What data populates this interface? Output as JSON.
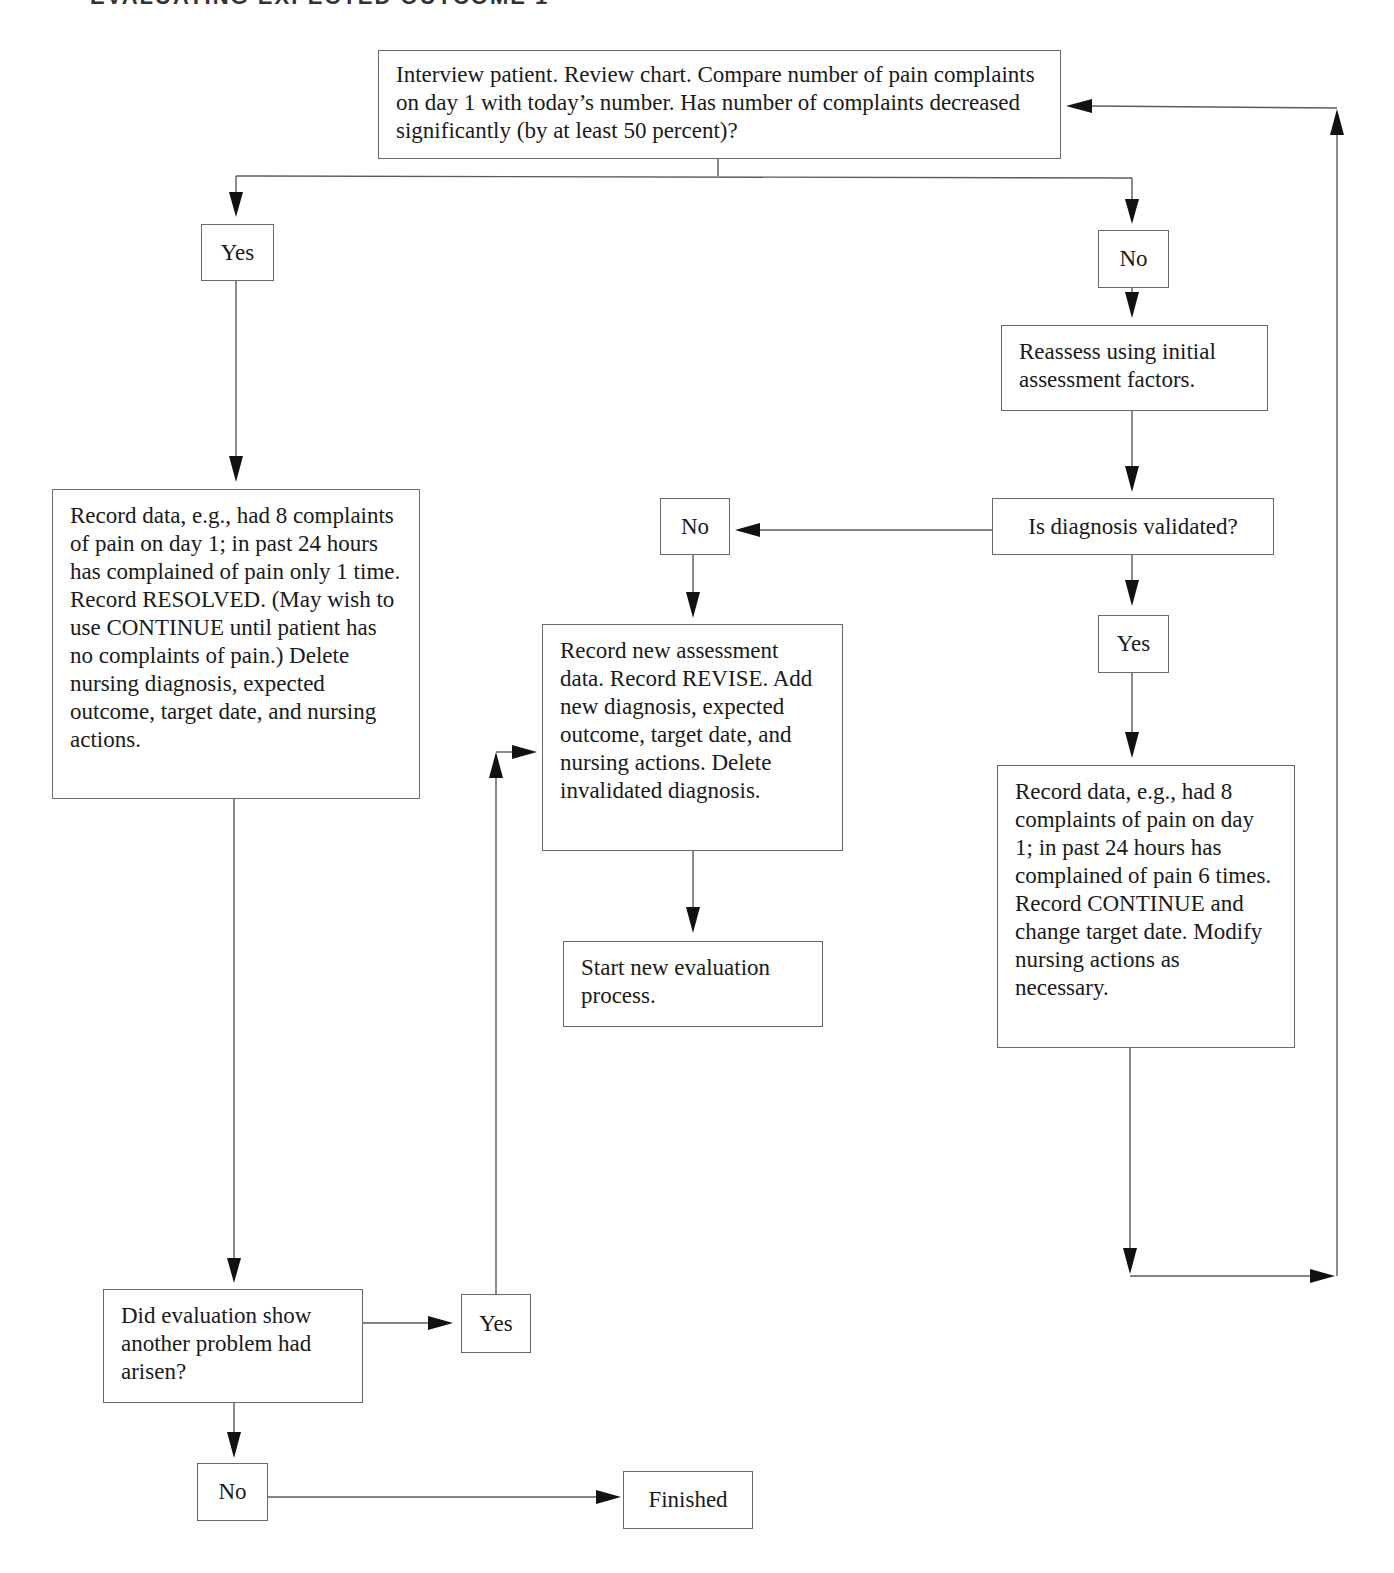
{
  "header": {
    "partial_title": "EVALUATING EXPECTED OUTCOME 1"
  },
  "nodes": {
    "start": "Interview patient. Review chart. Compare number of pain complaints on day 1 with today’s number. Has number of complaints decreased significantly (by at least 50 percent)?",
    "yes_top": "Yes",
    "no_top": "No",
    "reassess": "Reassess using initial assessment factors.",
    "record_resolved": "Record data, e.g., had 8 complaints of pain on day 1; in past 24 hours has complained of pain only 1 time. Record RESOLVED. (May wish to use CONTINUE until patient has no complaints of pain.) Delete nursing diagnosis, expected outcome, target date, and nursing actions.",
    "diag_validated": "Is diagnosis validated?",
    "no_diag": "No",
    "yes_diag": "Yes",
    "record_revise": "Record new assessment data. Record REVISE. Add new diagnosis, expected outcome, target date, and nursing actions. Delete invalidated diagnosis.",
    "start_new_eval": "Start new evaluation process.",
    "record_continue": "Record data, e.g., had 8 complaints of pain on day 1; in past 24 hours has complained of pain 6 times. Record CONTINUE and change target date. Modify nursing actions as necessary.",
    "another_problem": "Did evaluation show another problem had arisen?",
    "yes_problem": "Yes",
    "no_problem": "No",
    "finished": "Finished"
  },
  "colors": {
    "line": "#5a5a5a",
    "arrow": "#111111",
    "border": "#6a6a6a"
  }
}
